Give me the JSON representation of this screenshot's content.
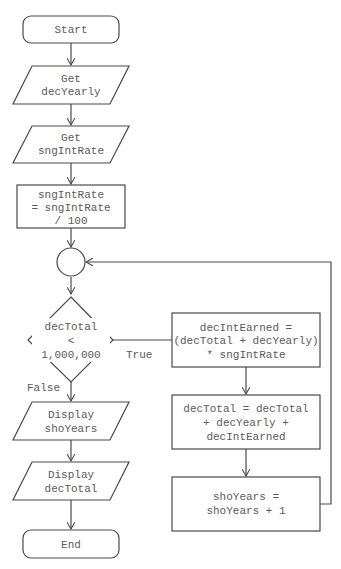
{
  "diagram": {
    "type": "flowchart",
    "nodes": {
      "start": {
        "shape": "terminator",
        "lines": [
          "Start"
        ]
      },
      "get_yearly": {
        "shape": "input",
        "lines": [
          "Get",
          "decYearly"
        ]
      },
      "get_rate": {
        "shape": "input",
        "lines": [
          "Get",
          "sngIntRate"
        ]
      },
      "calc_rate": {
        "shape": "process",
        "lines": [
          "sngIntRate",
          "= sngIntRate",
          "/ 100"
        ]
      },
      "connector": {
        "shape": "connector",
        "lines": []
      },
      "decision": {
        "shape": "decision",
        "lines": [
          "decTotal",
          "<",
          "1,000,000"
        ]
      },
      "calc_interest": {
        "shape": "process",
        "lines": [
          "decIntEarned =",
          "(decTotal + decYearly)",
          "* sngIntRate"
        ]
      },
      "update_total": {
        "shape": "process",
        "lines": [
          "decTotal = decTotal",
          "+ decYearly +",
          "decIntEarned"
        ]
      },
      "inc_years": {
        "shape": "process",
        "lines": [
          "shoYears =",
          "shoYears + 1"
        ]
      },
      "display_years": {
        "shape": "output",
        "lines": [
          "Display",
          "shoYears"
        ]
      },
      "display_total": {
        "shape": "output",
        "lines": [
          "Display",
          "decTotal"
        ]
      },
      "end": {
        "shape": "terminator",
        "lines": [
          "End"
        ]
      }
    },
    "edge_labels": {
      "true": "True",
      "false": "False"
    },
    "edges": [
      [
        "start",
        "get_yearly"
      ],
      [
        "get_yearly",
        "get_rate"
      ],
      [
        "get_rate",
        "calc_rate"
      ],
      [
        "calc_rate",
        "connector"
      ],
      [
        "connector",
        "decision"
      ],
      [
        "decision",
        "calc_interest",
        "True"
      ],
      [
        "calc_interest",
        "update_total"
      ],
      [
        "update_total",
        "inc_years"
      ],
      [
        "inc_years",
        "connector"
      ],
      [
        "decision",
        "display_years",
        "False"
      ],
      [
        "display_years",
        "display_total"
      ],
      [
        "display_total",
        "end"
      ]
    ]
  }
}
